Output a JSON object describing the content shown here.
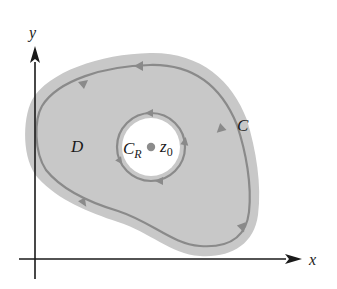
{
  "diagram": {
    "axes": {
      "x_label": "x",
      "y_label": "y"
    },
    "region": {
      "label": "D",
      "fill_color": "#c8c8c8"
    },
    "outer_contour": {
      "label": "C",
      "orientation": "counterclockwise",
      "stroke_color": "#8a8a8a"
    },
    "inner_contour": {
      "label_main": "C",
      "label_sub": "R",
      "orientation": "counterclockwise",
      "stroke_color": "#8a8a8a",
      "hole_color": "#ffffff"
    },
    "point": {
      "label_main": "z",
      "label_sub": "0",
      "color": "#8c8c8c"
    },
    "axis_color": "#1a1a1a"
  }
}
